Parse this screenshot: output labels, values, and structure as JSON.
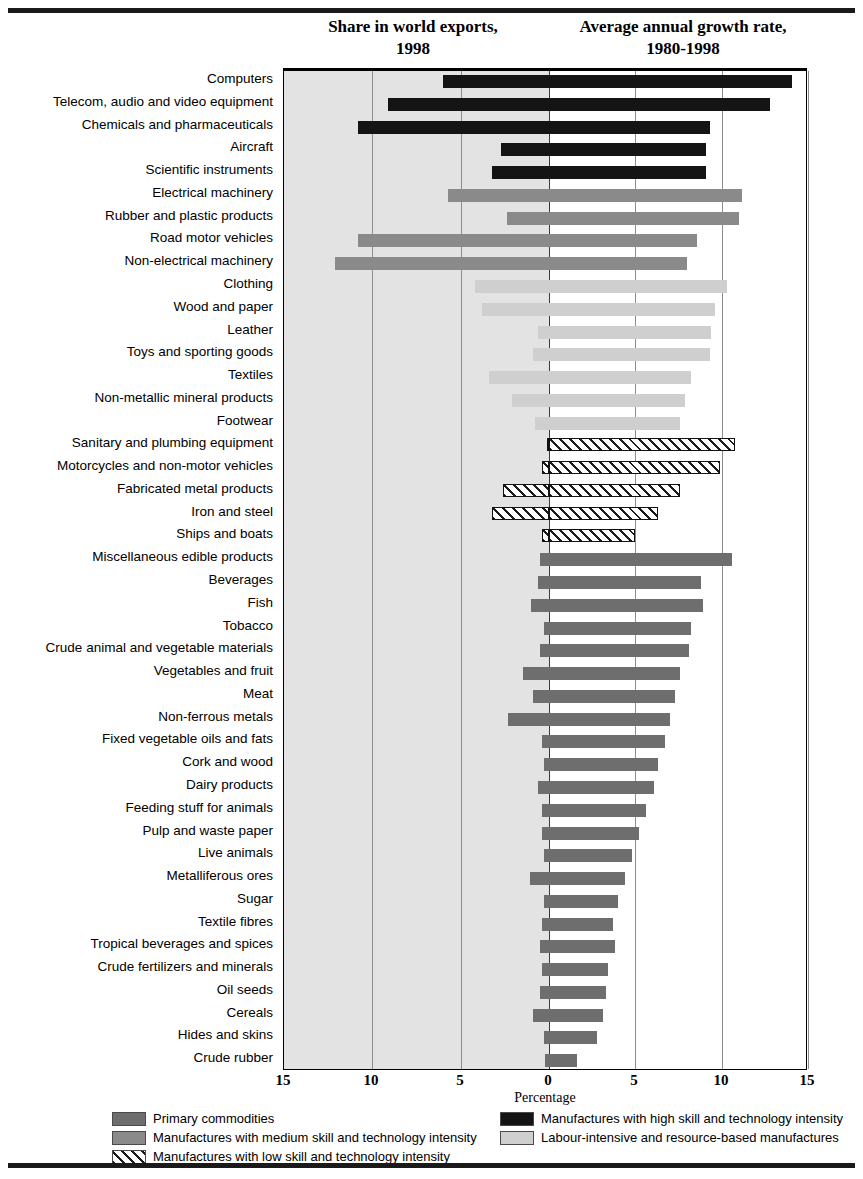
{
  "headings": {
    "share": "Share in world exports,\n1998",
    "share_line1": "Share in world exports,",
    "share_line2": "1998",
    "growth_line1": "Average annual growth rate,",
    "growth_line2": "1980-1998"
  },
  "axis": {
    "title": "Percentage",
    "ticks": [
      "15",
      "10",
      "5",
      "0",
      "5",
      "10",
      "15"
    ],
    "tick_values": [
      -15,
      -10,
      -5,
      0,
      5,
      10,
      15
    ]
  },
  "legend": {
    "items": [
      {
        "label": "Primary commodities",
        "key": "primary",
        "color": "#6e6e6e"
      },
      {
        "label": "Manufactures with high skill and technology intensity",
        "key": "high",
        "color": "#141414"
      },
      {
        "label": "Manufactures with medium skill and technology intensity",
        "key": "medium",
        "color": "#8a8a8a"
      },
      {
        "label": "Labour-intensive and resource-based manufactures",
        "key": "labour",
        "color": "#cfcfcf"
      },
      {
        "label": "Manufactures with low skill and technology intensity",
        "key": "low",
        "color": "#ffffff"
      }
    ]
  },
  "chart_data": {
    "type": "bar",
    "orientation": "horizontal-diverging",
    "title": "",
    "xlabel": "Percentage",
    "ylabel": "",
    "xlim": [
      -15,
      15
    ],
    "xticks": [
      -15,
      -10,
      -5,
      0,
      5,
      10,
      15
    ],
    "xticklabels": [
      "15",
      "10",
      "5",
      "0",
      "5",
      "10",
      "15"
    ],
    "grid": true,
    "legend_position": "bottom",
    "left_axis_label": "Share in world exports, 1998",
    "right_axis_label": "Average annual growth rate, 1980-1998",
    "series": [
      {
        "name": "Share in world exports, 1998",
        "side": "left"
      },
      {
        "name": "Average annual growth rate, 1980-1998",
        "side": "right"
      }
    ],
    "categories": [
      "Computers",
      "Telecom, audio and video equipment",
      "Chemicals and pharmaceuticals",
      "Aircraft",
      "Scientific instruments",
      "Electrical machinery",
      "Rubber and plastic products",
      "Road motor vehicles",
      "Non-electrical machinery",
      "Clothing",
      "Wood and paper",
      "Leather",
      "Toys and sporting goods",
      "Textiles",
      "Non-metallic mineral products",
      "Footwear",
      "Sanitary and plumbing equipment",
      "Motorcycles and non-motor vehicles",
      "Fabricated metal products",
      "Iron and steel",
      "Ships and boats",
      "Miscellaneous edible products",
      "Beverages",
      "Fish",
      "Tobacco",
      "Crude animal and vegetable materials",
      "Vegetables and fruit",
      "Meat",
      "Non-ferrous metals",
      "Fixed vegetable oils and fats",
      "Cork and wood",
      "Dairy products",
      "Feeding stuff for animals",
      "Pulp and waste paper",
      "Live animals",
      "Metalliferous ores",
      "Sugar",
      "Textile fibres",
      "Tropical beverages and spices",
      "Crude fertilizers and minerals",
      "Oil seeds",
      "Cereals",
      "Hides and skins",
      "Crude rubber"
    ],
    "groups": [
      "high",
      "high",
      "high",
      "high",
      "high",
      "medium",
      "medium",
      "medium",
      "medium",
      "labour",
      "labour",
      "labour",
      "labour",
      "labour",
      "labour",
      "labour",
      "low",
      "low",
      "low",
      "low",
      "low",
      "primary",
      "primary",
      "primary",
      "primary",
      "primary",
      "primary",
      "primary",
      "primary",
      "primary",
      "primary",
      "primary",
      "primary",
      "primary",
      "primary",
      "primary",
      "primary",
      "primary",
      "primary",
      "primary",
      "primary",
      "primary",
      "primary",
      "primary"
    ],
    "share": [
      6.0,
      9.1,
      10.8,
      2.7,
      3.2,
      5.7,
      2.4,
      10.8,
      12.1,
      4.2,
      3.8,
      0.6,
      0.9,
      3.4,
      2.1,
      0.8,
      0.1,
      0.4,
      2.6,
      3.2,
      0.4,
      0.5,
      0.6,
      1.0,
      0.3,
      0.5,
      1.5,
      0.9,
      2.3,
      0.4,
      0.3,
      0.6,
      0.4,
      0.4,
      0.3,
      1.1,
      0.3,
      0.4,
      0.5,
      0.4,
      0.5,
      0.9,
      0.3,
      0.2
    ],
    "growth": [
      14.1,
      12.8,
      9.3,
      9.1,
      9.1,
      11.2,
      11.0,
      8.6,
      8.0,
      10.3,
      9.6,
      9.4,
      9.3,
      8.2,
      7.9,
      7.6,
      10.8,
      9.9,
      7.6,
      6.3,
      5.0,
      10.6,
      8.8,
      8.9,
      8.2,
      8.1,
      7.6,
      7.3,
      7.0,
      6.7,
      6.3,
      6.1,
      5.6,
      5.2,
      4.8,
      4.4,
      4.0,
      3.7,
      3.8,
      3.4,
      3.3,
      3.1,
      2.8,
      1.6
    ]
  }
}
